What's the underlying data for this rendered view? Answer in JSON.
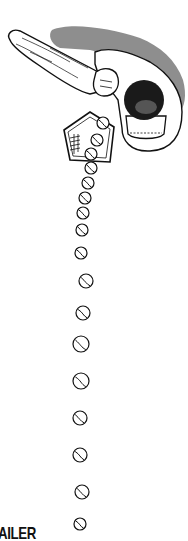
{
  "illustration": {
    "subject": "top-down view of baseball batter swinging bat over home plate",
    "colors": {
      "ink": "#111111",
      "shadow": "#7a7a7a",
      "background": "#ffffff",
      "helmet": "#1a1a1a"
    },
    "balls": [
      {
        "x": 103,
        "y": 123,
        "r": 6
      },
      {
        "x": 97,
        "y": 140,
        "r": 6
      },
      {
        "x": 91,
        "y": 154,
        "r": 6
      },
      {
        "x": 91,
        "y": 168,
        "r": 6
      },
      {
        "x": 88,
        "y": 183,
        "r": 6
      },
      {
        "x": 85,
        "y": 198,
        "r": 6
      },
      {
        "x": 83,
        "y": 213,
        "r": 6
      },
      {
        "x": 82,
        "y": 230,
        "r": 6
      },
      {
        "x": 81,
        "y": 253,
        "r": 6
      },
      {
        "x": 86,
        "y": 281,
        "r": 7
      },
      {
        "x": 83,
        "y": 313,
        "r": 7
      },
      {
        "x": 81,
        "y": 344,
        "r": 8
      },
      {
        "x": 81,
        "y": 381,
        "r": 8
      },
      {
        "x": 80,
        "y": 418,
        "r": 7
      },
      {
        "x": 80,
        "y": 455,
        "r": 7
      },
      {
        "x": 82,
        "y": 492,
        "r": 7
      },
      {
        "x": 80,
        "y": 524,
        "r": 6
      }
    ]
  },
  "caption": {
    "text": "AILER"
  }
}
